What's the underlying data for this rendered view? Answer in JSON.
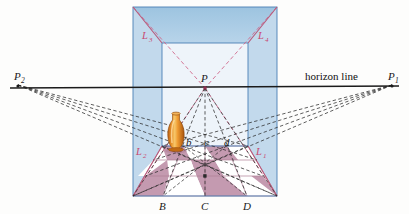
{
  "figure": {
    "background_color": "#fdfdfc"
  },
  "horizon": {
    "label": "horizon line",
    "color": "#1b1b1b",
    "y": 88
  },
  "vanishing_points": {
    "left": {
      "label": "P",
      "subscript": "2",
      "x": 18,
      "y": 85
    },
    "right": {
      "label": "P",
      "subscript": "1",
      "x": 392,
      "y": 85
    },
    "center": {
      "label": "P",
      "x": 205,
      "y": 88
    }
  },
  "diagonal_labels": [
    {
      "label": "L",
      "subscript": "1",
      "x": 256,
      "y": 154,
      "color": "#c8476e"
    },
    {
      "label": "L",
      "subscript": "2",
      "x": 136,
      "y": 154,
      "color": "#c8476e"
    },
    {
      "label": "L",
      "subscript": "3",
      "x": 142,
      "y": 38,
      "color": "#c8476e"
    },
    {
      "label": "L",
      "subscript": "4",
      "x": 258,
      "y": 38,
      "color": "#c8476e"
    }
  ],
  "floor_points_upper": [
    {
      "label": "b",
      "x": 189,
      "y": 143
    },
    {
      "label": "c",
      "x": 207,
      "y": 143
    },
    {
      "label": "d",
      "x": 227,
      "y": 143
    }
  ],
  "floor_points_lower": [
    {
      "label": "B",
      "x": 163,
      "y": 208
    },
    {
      "label": "C",
      "x": 205,
      "y": 208
    },
    {
      "label": "D",
      "x": 247,
      "y": 208
    }
  ],
  "room": {
    "outer_box": {
      "x1": 133,
      "y1": 7,
      "x2": 277,
      "y2": 196
    },
    "back_wall": {
      "x1": 162,
      "y1": 43,
      "x2": 248,
      "y2": 146
    },
    "wall_color": "#c2d9ec",
    "ceiling_color": "#a8cbe4",
    "back_wall_color": "#eef4fa",
    "outline_color": "#4a7fb5"
  },
  "floor": {
    "tile_color": "#c49ab0",
    "tile_color_alt": "#ffffff",
    "grid_color": "#b07e96",
    "rows": 3,
    "cols": 4
  },
  "vase": {
    "name": "vase",
    "x": 175,
    "y": 113,
    "width": 18,
    "height": 38,
    "color_body": "#e8922b",
    "color_highlight": "#f7c76a",
    "color_shadow": "#b85f12"
  },
  "colors": {
    "dashed_black": "#2a2a2a",
    "dashed_pink": "#d06a8c",
    "horizon": "#1b1b1b"
  }
}
